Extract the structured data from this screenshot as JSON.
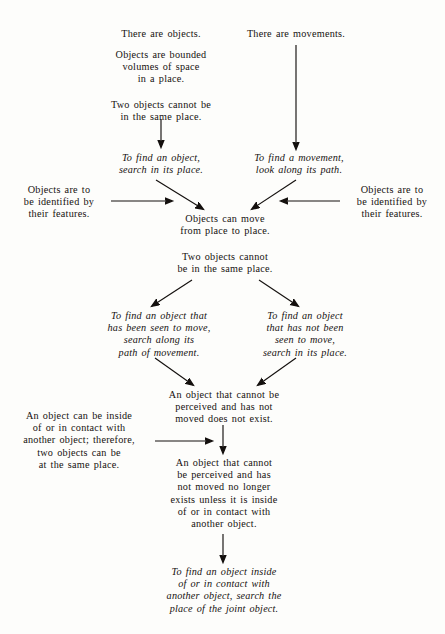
{
  "document": {
    "type": "flow-diagram",
    "title": "Objects and movements inference diagram",
    "background_color": "#fdfdfb",
    "text_color": "#16110f"
  },
  "nodes": {
    "there_are_objects": {
      "lines": [
        "There are objects."
      ],
      "style": "roman"
    },
    "objects_are_bounded": {
      "lines": [
        "Objects are bounded",
        "volumes of space",
        "in a place."
      ],
      "style": "roman"
    },
    "two_objects_cannot_top": {
      "lines": [
        "Two objects cannot be",
        "in the same place."
      ],
      "style": "roman"
    },
    "there_are_movements": {
      "lines": [
        "There are movements."
      ],
      "style": "roman"
    },
    "to_find_an_object_search_place": {
      "lines": [
        "To find an object,",
        "search in its place."
      ],
      "style": "italic"
    },
    "to_find_a_movement": {
      "lines": [
        "To find a movement,",
        "look along its path."
      ],
      "style": "italic"
    },
    "objects_identified_left": {
      "lines": [
        "Objects are to",
        "be identified by",
        "their features."
      ],
      "style": "roman"
    },
    "objects_identified_right": {
      "lines": [
        "Objects are to",
        "be identified by",
        "their features."
      ],
      "style": "roman"
    },
    "objects_can_move": {
      "lines": [
        "Objects can move",
        "from place to place."
      ],
      "style": "roman"
    },
    "two_objects_cannot_mid": {
      "lines": [
        "Two objects cannot",
        "be in the same place."
      ],
      "style": "roman"
    },
    "to_find_object_seen_to_move": {
      "lines": [
        "To find an object that",
        "has been seen to move,",
        "search along its",
        "path of movement."
      ],
      "style": "italic"
    },
    "to_find_object_not_seen": {
      "lines": [
        "To find an object",
        "that has not been",
        "seen to move,",
        "search in its place."
      ],
      "style": "italic"
    },
    "cannot_be_perceived_not_exist": {
      "lines": [
        "An object that cannot be",
        "perceived and has not",
        "moved does not exist."
      ],
      "style": "roman"
    },
    "object_can_be_inside": {
      "lines": [
        "An object can be inside",
        "of or in contact with",
        "another object; therefore,",
        "two objects can be",
        "at the same place."
      ],
      "style": "roman"
    },
    "no_longer_exists_unless": {
      "lines": [
        "An object that cannot",
        "be perceived and has",
        "not moved no longer",
        "exists unless it is inside",
        "of or in contact with",
        "another object."
      ],
      "style": "roman"
    },
    "to_find_object_inside": {
      "lines": [
        "To find an object inside",
        "of or in contact with",
        "another object, search the",
        "place of the joint object."
      ],
      "style": "italic"
    }
  },
  "arrows": [
    {
      "name": "objects-to-find-object",
      "kind": "vertical-down"
    },
    {
      "name": "movements-to-find-movement",
      "kind": "vertical-down-long"
    },
    {
      "name": "find-object-to-objects-can-move",
      "kind": "diagonal-down-right"
    },
    {
      "name": "find-movement-to-objects-can-move",
      "kind": "diagonal-down-left"
    },
    {
      "name": "identified-left-to-center",
      "kind": "horizontal-right"
    },
    {
      "name": "identified-right-to-center",
      "kind": "horizontal-left"
    },
    {
      "name": "two-objects-to-seen-to-move",
      "kind": "diagonal-down-left"
    },
    {
      "name": "two-objects-to-not-seen",
      "kind": "diagonal-down-right"
    },
    {
      "name": "seen-to-move-to-not-exist",
      "kind": "diagonal-down-right"
    },
    {
      "name": "not-seen-to-not-exist",
      "kind": "diagonal-down-left"
    },
    {
      "name": "inside-contact-to-no-longer-exists",
      "kind": "horizontal-right"
    },
    {
      "name": "not-exist-to-no-longer-exists",
      "kind": "vertical-down"
    },
    {
      "name": "no-longer-exists-to-find-inside",
      "kind": "vertical-down"
    }
  ]
}
